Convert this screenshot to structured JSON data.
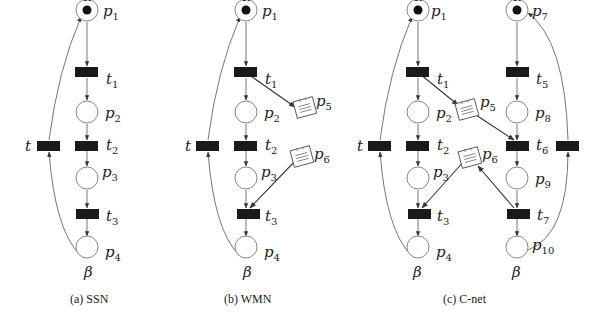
{
  "diagram": {
    "type": "petri-net-comparison",
    "panels": [
      {
        "id": "a",
        "caption": "(a) SSN",
        "places": [
          {
            "id": "p1",
            "label": "p",
            "sub": "1",
            "token": true,
            "top_label": "α"
          },
          {
            "id": "p2",
            "label": "p",
            "sub": "2"
          },
          {
            "id": "p3",
            "label": "p",
            "sub": "3"
          },
          {
            "id": "p4",
            "label": "p",
            "sub": "4",
            "bottom_label": "β"
          }
        ],
        "transitions": [
          {
            "id": "t1",
            "label": "t",
            "sub": "1"
          },
          {
            "id": "t2",
            "label": "t",
            "sub": "2"
          },
          {
            "id": "t3",
            "label": "t",
            "sub": "3"
          },
          {
            "id": "t",
            "label": "t",
            "sub": ""
          }
        ]
      },
      {
        "id": "b",
        "caption": "(b) WMN",
        "places": [
          {
            "id": "p1",
            "label": "p",
            "sub": "1",
            "token": true,
            "top_label": "α"
          },
          {
            "id": "p2",
            "label": "p",
            "sub": "2"
          },
          {
            "id": "p3",
            "label": "p",
            "sub": "3"
          },
          {
            "id": "p4",
            "label": "p",
            "sub": "4",
            "bottom_label": "β"
          },
          {
            "id": "p5",
            "label": "p",
            "sub": "5",
            "kind": "message"
          },
          {
            "id": "p6",
            "label": "p",
            "sub": "6",
            "kind": "message"
          }
        ],
        "transitions": [
          {
            "id": "t1",
            "label": "t",
            "sub": "1"
          },
          {
            "id": "t2",
            "label": "t",
            "sub": "2"
          },
          {
            "id": "t3",
            "label": "t",
            "sub": "3"
          },
          {
            "id": "t",
            "label": "t",
            "sub": ""
          }
        ]
      },
      {
        "id": "c",
        "caption": "(c) C-net",
        "places": [
          {
            "id": "p1",
            "label": "p",
            "sub": "1",
            "token": true,
            "top_label": "α"
          },
          {
            "id": "p2",
            "label": "p",
            "sub": "2"
          },
          {
            "id": "p3",
            "label": "p",
            "sub": "3"
          },
          {
            "id": "p4",
            "label": "p",
            "sub": "4",
            "bottom_label": "β"
          },
          {
            "id": "p5",
            "label": "p",
            "sub": "5",
            "kind": "message"
          },
          {
            "id": "p6",
            "label": "p",
            "sub": "6",
            "kind": "message"
          },
          {
            "id": "p7",
            "label": "p",
            "sub": "7",
            "token": true,
            "top_label": "α"
          },
          {
            "id": "p8",
            "label": "p",
            "sub": "8"
          },
          {
            "id": "p9",
            "label": "p",
            "sub": "9"
          },
          {
            "id": "p10",
            "label": "p",
            "sub": "10",
            "bottom_label": "β"
          }
        ],
        "transitions": [
          {
            "id": "t1",
            "label": "t",
            "sub": "1"
          },
          {
            "id": "t2",
            "label": "t",
            "sub": "2"
          },
          {
            "id": "t3",
            "label": "t",
            "sub": "3"
          },
          {
            "id": "t5",
            "label": "t",
            "sub": "5"
          },
          {
            "id": "t6",
            "label": "t",
            "sub": "6"
          },
          {
            "id": "t7",
            "label": "t",
            "sub": "7"
          },
          {
            "id": "t",
            "label": "t",
            "sub": ""
          }
        ]
      }
    ],
    "symbols": {
      "alpha": "α",
      "beta": "β"
    },
    "colors": {
      "transition": "#1a1a1a",
      "place_stroke": "#888888",
      "token": "#111111",
      "arc": "#666666"
    }
  }
}
